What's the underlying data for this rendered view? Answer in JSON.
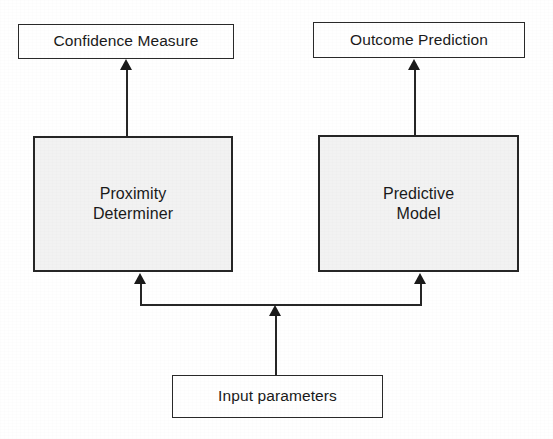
{
  "diagram": {
    "type": "block-diagram",
    "title": "",
    "background_color": "#ffffff",
    "line_color": "#262626",
    "process_fill_color": "#f2f2f2",
    "nodes": [
      {
        "id": "confidence-measure",
        "label": "Confidence Measure",
        "role": "output",
        "fill": "#ffffff"
      },
      {
        "id": "outcome-prediction",
        "label": "Outcome Prediction",
        "role": "output",
        "fill": "#ffffff"
      },
      {
        "id": "proximity-determiner",
        "label": "Proximity\nDeterminer",
        "role": "process",
        "fill": "#f2f2f2"
      },
      {
        "id": "predictive-model",
        "label": "Predictive\nModel",
        "role": "process",
        "fill": "#f2f2f2"
      },
      {
        "id": "input-parameters",
        "label": "Input parameters",
        "role": "input",
        "fill": "#ffffff"
      }
    ],
    "edges": [
      {
        "id": "edge-input-to-bus",
        "from": "input-parameters",
        "to": "bus",
        "arrow": "up"
      },
      {
        "id": "edge-bus-to-proximity",
        "from": "bus",
        "to": "proximity-determiner",
        "arrow": "up"
      },
      {
        "id": "edge-bus-to-predictive",
        "from": "bus",
        "to": "predictive-model",
        "arrow": "up"
      },
      {
        "id": "edge-proximity-to-confidence",
        "from": "proximity-determiner",
        "to": "confidence-measure",
        "arrow": "up"
      },
      {
        "id": "edge-predictive-to-outcome",
        "from": "predictive-model",
        "to": "outcome-prediction",
        "arrow": "up"
      }
    ]
  }
}
